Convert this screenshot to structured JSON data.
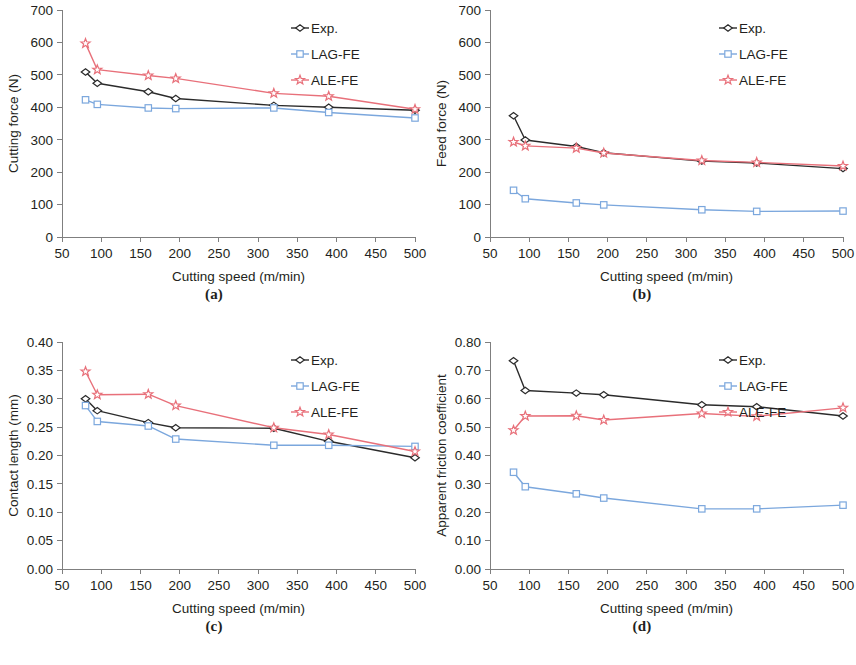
{
  "figure": {
    "panels": [
      {
        "id": "a",
        "caption": "(a)",
        "chart_data": {
          "type": "line",
          "title": "",
          "xlabel": "Cutting speed (m/min)",
          "ylabel": "Cutting force (N)",
          "xlim": [
            50,
            500
          ],
          "ylim": [
            0,
            700
          ],
          "xticks": [
            50,
            100,
            150,
            200,
            250,
            300,
            350,
            400,
            450,
            500
          ],
          "yticks": [
            0,
            100,
            200,
            300,
            400,
            500,
            600,
            700
          ],
          "xticklabels": [
            "50",
            "100",
            "150",
            "200",
            "250",
            "300",
            "350",
            "400",
            "450",
            "500"
          ],
          "yticklabels": [
            "0",
            "100",
            "200",
            "300",
            "400",
            "500",
            "600",
            "700"
          ],
          "grid": false,
          "legend_position": "upper right",
          "x": [
            80,
            95,
            160,
            195,
            320,
            390,
            500
          ],
          "series": [
            {
              "name": "Exp.",
              "color": "#2b2b2b",
              "marker": "diamond",
              "values": [
                509,
                474,
                448,
                427,
                406,
                400,
                391
              ]
            },
            {
              "name": "LAG-FE",
              "color": "#7ba7dd",
              "marker": "square",
              "values": [
                423,
                409,
                398,
                396,
                398,
                384,
                367
              ]
            },
            {
              "name": "ALE-FE",
              "color": "#e8707a",
              "marker": "star",
              "values": [
                597,
                516,
                498,
                489,
                443,
                434,
                394
              ]
            }
          ]
        }
      },
      {
        "id": "b",
        "caption": "(b)",
        "chart_data": {
          "type": "line",
          "title": "",
          "xlabel": "Cutting speed (m/min)",
          "ylabel": "Feed force (N)",
          "xlim": [
            50,
            500
          ],
          "ylim": [
            0,
            700
          ],
          "xticks": [
            50,
            100,
            150,
            200,
            250,
            300,
            350,
            400,
            450,
            500
          ],
          "yticks": [
            0,
            100,
            200,
            300,
            400,
            500,
            600,
            700
          ],
          "xticklabels": [
            "50",
            "100",
            "150",
            "200",
            "250",
            "300",
            "350",
            "400",
            "450",
            "500"
          ],
          "yticklabels": [
            "0",
            "100",
            "200",
            "300",
            "400",
            "500",
            "600",
            "700"
          ],
          "grid": false,
          "legend_position": "upper right",
          "x": [
            80,
            95,
            160,
            195,
            320,
            390,
            500
          ],
          "series": [
            {
              "name": "Exp.",
              "color": "#2b2b2b",
              "marker": "diamond",
              "values": [
                374,
                299,
                279,
                260,
                234,
                228,
                211
              ]
            },
            {
              "name": "LAG-FE",
              "color": "#7ba7dd",
              "marker": "square",
              "values": [
                144,
                118,
                105,
                99,
                84,
                79,
                80
              ]
            },
            {
              "name": "ALE-FE",
              "color": "#e8707a",
              "marker": "star",
              "values": [
                293,
                281,
                274,
                259,
                236,
                230,
                219
              ]
            }
          ]
        }
      },
      {
        "id": "c",
        "caption": "(c)",
        "chart_data": {
          "type": "line",
          "title": "",
          "xlabel": "Cutting speed (m/min)",
          "ylabel": "Contact length (mm)",
          "xlim": [
            50,
            500
          ],
          "ylim": [
            0.0,
            0.4
          ],
          "xticks": [
            50,
            100,
            150,
            200,
            250,
            300,
            350,
            400,
            450,
            500
          ],
          "yticks": [
            0.0,
            0.05,
            0.1,
            0.15,
            0.2,
            0.25,
            0.3,
            0.35,
            0.4
          ],
          "xticklabels": [
            "50",
            "100",
            "150",
            "200",
            "250",
            "300",
            "350",
            "400",
            "450",
            "500"
          ],
          "yticklabels": [
            "0.00",
            "0.05",
            "0.10",
            "0.15",
            "0.20",
            "0.25",
            "0.30",
            "0.35",
            "0.40"
          ],
          "grid": false,
          "legend_position": "upper right",
          "x": [
            80,
            95,
            160,
            195,
            320,
            390,
            500
          ],
          "series": [
            {
              "name": "Exp.",
              "color": "#2b2b2b",
              "marker": "diamond",
              "values": [
                0.3,
                0.279,
                0.258,
                0.249,
                0.248,
                0.225,
                0.196
              ]
            },
            {
              "name": "LAG-FE",
              "color": "#7ba7dd",
              "marker": "square",
              "values": [
                0.288,
                0.26,
                0.252,
                0.229,
                0.218,
                0.218,
                0.216
              ]
            },
            {
              "name": "ALE-FE",
              "color": "#e8707a",
              "marker": "star",
              "values": [
                0.348,
                0.307,
                0.308,
                0.288,
                0.249,
                0.237,
                0.207
              ]
            }
          ]
        }
      },
      {
        "id": "d",
        "caption": "(d)",
        "chart_data": {
          "type": "line",
          "title": "",
          "xlabel": "Cutting speed (m/min)",
          "ylabel": "Apparent friction coefficient",
          "xlim": [
            50,
            500
          ],
          "ylim": [
            0.0,
            0.8
          ],
          "xticks": [
            50,
            100,
            150,
            200,
            250,
            300,
            350,
            400,
            450,
            500
          ],
          "yticks": [
            0.0,
            0.1,
            0.2,
            0.3,
            0.4,
            0.5,
            0.6,
            0.7,
            0.8
          ],
          "xticklabels": [
            "50",
            "100",
            "150",
            "200",
            "250",
            "300",
            "350",
            "400",
            "450",
            "500"
          ],
          "yticklabels": [
            "0.00",
            "0.10",
            "0.20",
            "0.30",
            "0.40",
            "0.50",
            "0.60",
            "0.70",
            "0.80"
          ],
          "grid": false,
          "legend_position": "upper right",
          "x": [
            80,
            95,
            160,
            195,
            320,
            390,
            500
          ],
          "series": [
            {
              "name": "Exp.",
              "color": "#2b2b2b",
              "marker": "diamond",
              "values": [
                0.734,
                0.629,
                0.62,
                0.614,
                0.579,
                0.572,
                0.539
              ]
            },
            {
              "name": "LAG-FE",
              "color": "#7ba7dd",
              "marker": "square",
              "values": [
                0.341,
                0.29,
                0.265,
                0.25,
                0.212,
                0.212,
                0.225
              ]
            },
            {
              "name": "ALE-FE",
              "color": "#e8707a",
              "marker": "star",
              "values": [
                0.489,
                0.539,
                0.54,
                0.525,
                0.548,
                0.538,
                0.568
              ]
            }
          ]
        }
      }
    ]
  }
}
